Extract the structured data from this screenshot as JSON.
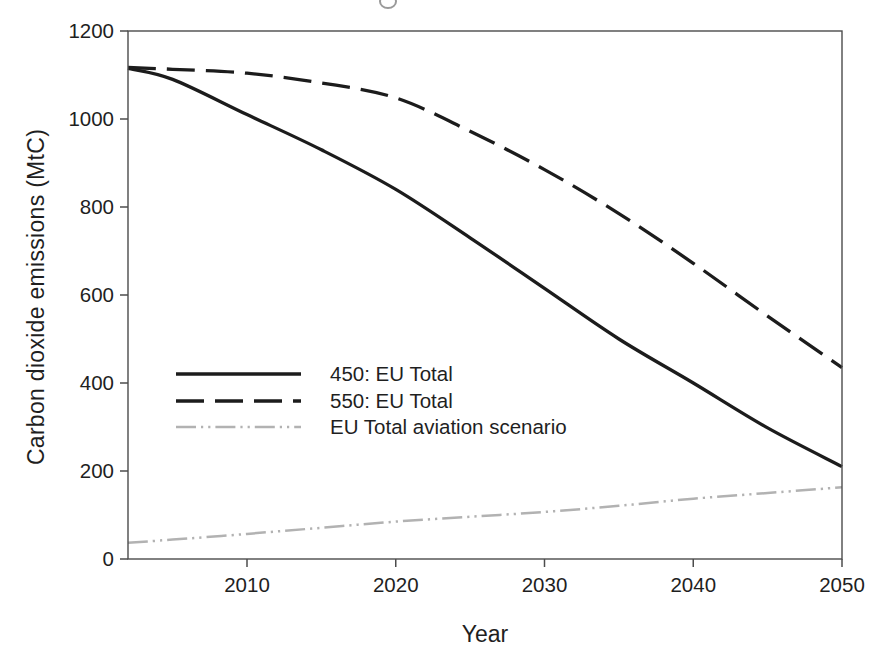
{
  "figure": {
    "background": "#ffffff"
  },
  "chart_data": {
    "type": "line",
    "title": "",
    "xlabel": "Year",
    "ylabel": "Carbon dioxide emissions (MtC)",
    "xlim": [
      2002,
      2050
    ],
    "ylim": [
      0,
      1200
    ],
    "x_tick_values": [
      2010,
      2020,
      2030,
      2040,
      2050
    ],
    "x_tick_labels": [
      "2010",
      "2020",
      "2030",
      "2040",
      "2050"
    ],
    "y_tick_values": [
      0,
      200,
      400,
      600,
      800,
      1000,
      1200
    ],
    "y_tick_labels": [
      "0",
      "200",
      "400",
      "600",
      "800",
      "1000",
      "1200"
    ],
    "grid": false,
    "legend_position": "inside-left-middle",
    "axis_color": "#4c4c4c",
    "text_color": "#1f1f1f",
    "x": [
      2002,
      2005,
      2010,
      2015,
      2020,
      2025,
      2030,
      2035,
      2040,
      2045,
      2050
    ],
    "series": [
      {
        "name": "450: EU Total",
        "line_style": "solid",
        "color": "#1c1c1c",
        "width": 3.3,
        "values": [
          1115,
          1090,
          1010,
          930,
          840,
          730,
          615,
          500,
          400,
          298,
          210
        ]
      },
      {
        "name": "550: EU Total",
        "line_style": "dashed",
        "color": "#1c1c1c",
        "width": 3.3,
        "values": [
          1117,
          1113,
          1104,
          1082,
          1048,
          972,
          885,
          785,
          672,
          552,
          435
        ]
      },
      {
        "name": "EU Total aviation scenario",
        "line_style": "dash-dot-dot",
        "color": "#b2b2b2",
        "width": 2.5,
        "values": [
          37,
          44,
          57,
          71,
          85,
          96,
          107,
          121,
          137,
          150,
          163
        ]
      }
    ]
  }
}
